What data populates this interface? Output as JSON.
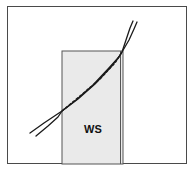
{
  "figure": {
    "width": 196,
    "height": 176,
    "background_color": "#ffffff",
    "frame": {
      "stroke_color": "#4a4a4a",
      "stroke_width": 1,
      "x": 7,
      "y": 6,
      "width": 180,
      "height": 158
    }
  },
  "labels": {
    "shaded_region_label": "WS"
  },
  "chart_data": {
    "type": "line",
    "title": "",
    "subtitle": "",
    "xlabel": "",
    "ylabel": "",
    "grid": false,
    "legend_position": "none",
    "xlim": [
      7,
      187
    ],
    "ylim": [
      164,
      6
    ],
    "axis_units": "pixels",
    "annotations": [
      {
        "name": "shaded-band-label",
        "text": "WS",
        "x": 93,
        "y": 129
      }
    ],
    "regions": [
      {
        "name": "ws-shaded-band",
        "label": "WS",
        "type": "rectangle",
        "x": 62,
        "y": 51,
        "width": 61,
        "height": 113,
        "fill": "#eaeaea",
        "stroke": "#555555",
        "stroke_width": 1,
        "double_right_edge": true
      }
    ],
    "series": [
      {
        "name": "profile-line-upper",
        "stroke": "#1b1b1b",
        "stroke_width": 1.3,
        "points": [
          [
            30,
            133
          ],
          [
            44,
            123
          ],
          [
            56,
            115
          ],
          [
            62,
            111
          ],
          [
            78,
            99
          ],
          [
            95,
            84
          ],
          [
            110,
            68
          ],
          [
            119,
            57
          ],
          [
            122,
            52
          ],
          [
            126,
            40
          ],
          [
            130,
            28
          ],
          [
            133,
            21
          ]
        ]
      },
      {
        "name": "profile-line-lower",
        "stroke": "#1b1b1b",
        "stroke_width": 1.3,
        "points": [
          [
            36,
            136
          ],
          [
            48,
            126
          ],
          [
            58,
            117
          ],
          [
            62,
            111
          ],
          [
            76,
            100
          ],
          [
            93,
            85
          ],
          [
            108,
            69
          ],
          [
            118,
            58
          ],
          [
            122,
            52
          ],
          [
            129,
            40
          ],
          [
            134,
            29
          ],
          [
            137,
            22
          ]
        ]
      },
      {
        "name": "profile-line-center-dashed",
        "stroke": "#1b1b1b",
        "stroke_width": 1.4,
        "dash": "3 1.5",
        "points": [
          [
            62,
            111
          ],
          [
            80,
            96
          ],
          [
            100,
            79
          ],
          [
            115,
            63
          ],
          [
            122,
            52
          ]
        ]
      }
    ],
    "crossings": [
      {
        "name": "lower-left-crossing",
        "x": 62,
        "y": 111
      },
      {
        "name": "upper-right-crossing",
        "x": 122,
        "y": 52
      }
    ]
  }
}
